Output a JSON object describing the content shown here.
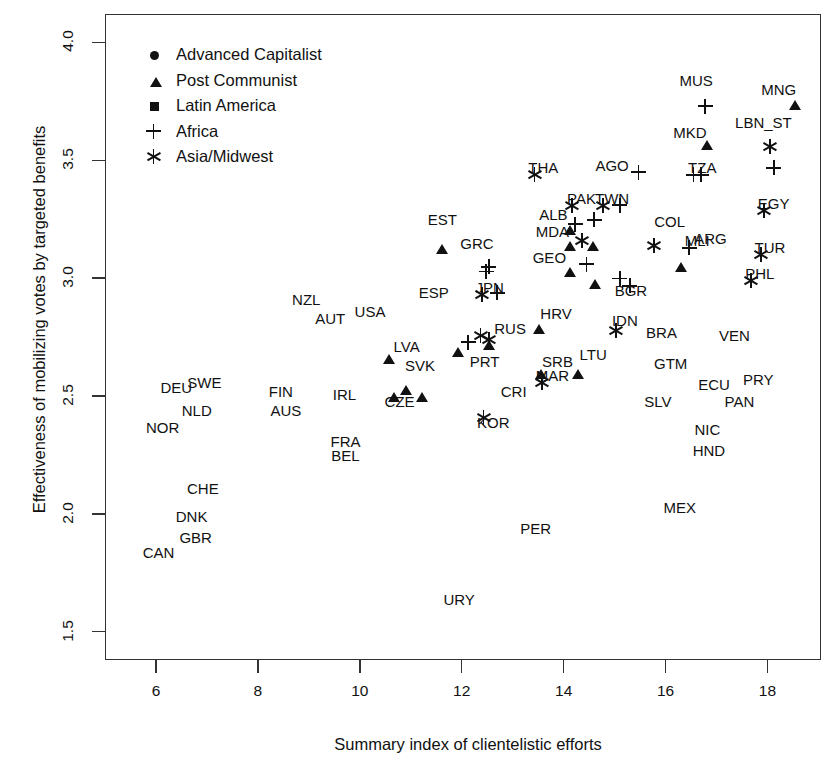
{
  "chart_data": {
    "type": "scatter",
    "title": "",
    "xlabel": "Summary index of clientelistic efforts",
    "ylabel": "Effectiveness of mobilizing votes by targeted benefits",
    "xlim": [
      5.0,
      19.05
    ],
    "ylim": [
      1.38,
      4.12
    ],
    "xticks": [
      6,
      8,
      10,
      12,
      14,
      16,
      18
    ],
    "xtick_labels": [
      "6",
      "8",
      "10",
      "12",
      "14",
      "16",
      "18"
    ],
    "yticks": [
      1.5,
      2.0,
      2.5,
      3.0,
      3.5,
      4.0
    ],
    "ytick_labels": [
      "1.5",
      "2.0",
      "2.5",
      "3.0",
      "3.5",
      "4.0"
    ],
    "grid": false,
    "legend_position": "top-left",
    "legend": [
      {
        "label": "Advanced Capitalist",
        "marker": "circle",
        "icon": "filled-circle-icon"
      },
      {
        "label": "Post Communist",
        "marker": "triangle",
        "icon": "filled-triangle-icon"
      },
      {
        "label": "Latin America",
        "marker": "square",
        "icon": "filled-square-icon"
      },
      {
        "label": "Africa",
        "marker": "plus",
        "icon": "plus-icon"
      },
      {
        "label": "Asia/Midwest",
        "marker": "star",
        "icon": "asterisk-icon"
      }
    ],
    "series": [
      {
        "name": "Advanced Capitalist",
        "marker": "circle",
        "points": [
          {
            "label": "CAN",
            "x": 5.8,
            "y": 1.89,
            "lx": 6.05,
            "ly": 1.84
          },
          {
            "label": "DNK",
            "x": 6.3,
            "y": 1.96,
            "lx": 6.7,
            "ly": 1.99
          },
          {
            "label": "GBR",
            "x": 6.36,
            "y": 1.94,
            "lx": 6.78,
            "ly": 1.9
          },
          {
            "label": "CHE",
            "x": 6.5,
            "y": 2.11,
            "lx": 6.92,
            "ly": 2.11
          },
          {
            "label": "NOR",
            "x": 6.02,
            "y": 2.42,
            "lx": 6.13,
            "ly": 2.37
          },
          {
            "label": "NLD",
            "x": 6.37,
            "y": 2.44,
            "lx": 6.8,
            "ly": 2.44
          },
          {
            "label": "DEU",
            "x": 6.6,
            "y": 2.47,
            "lx": 6.4,
            "ly": 2.54
          },
          {
            "label": "SWE",
            "x": 6.82,
            "y": 2.5,
            "lx": 6.95,
            "ly": 2.56
          },
          {
            "label": "FIN",
            "x": 8.1,
            "y": 2.52,
            "lx": 8.45,
            "ly": 2.52
          },
          {
            "label": "AUS",
            "x": 8.18,
            "y": 2.44,
            "lx": 8.55,
            "ly": 2.44
          },
          {
            "label": "IRL",
            "x": 9.32,
            "y": 2.51,
            "lx": 9.7,
            "ly": 2.51
          },
          {
            "label": "FRA",
            "x": 9.35,
            "y": 2.31,
            "lx": 9.72,
            "ly": 2.31
          },
          {
            "label": "BEL",
            "x": 9.35,
            "y": 2.25,
            "lx": 9.72,
            "ly": 2.25
          },
          {
            "label": "NZL",
            "x": 8.85,
            "y": 2.84,
            "lx": 8.95,
            "ly": 2.91
          },
          {
            "label": "AUT",
            "x": 9.33,
            "y": 2.76,
            "lx": 9.42,
            "ly": 2.83
          },
          {
            "label": "USA",
            "x": 10.15,
            "y": 2.79,
            "lx": 10.2,
            "ly": 2.86
          },
          {
            "label": "ESP",
            "x": 11.42,
            "y": 2.87,
            "lx": 11.45,
            "ly": 2.94
          },
          {
            "label": "PRT",
            "x": 12.13,
            "y": 2.67,
            "lx": 12.45,
            "ly": 2.65
          },
          {
            "label": "GRC",
            "x": 12.33,
            "y": 3.09,
            "lx": 12.3,
            "ly": 3.15
          },
          {
            "label": "RUS",
            "x": 12.65,
            "y": 2.79,
            "lx": 12.95,
            "ly": 2.79
          }
        ]
      },
      {
        "name": "Post Communist",
        "marker": "triangle",
        "points": [
          {
            "label": "LVA",
            "x": 10.58,
            "y": 2.71,
            "lx": 10.92,
            "ly": 2.71
          },
          {
            "label": "CZE",
            "x": 10.68,
            "y": 2.55,
            "lx": 10.78,
            "ly": 2.48
          },
          {
            "label": "SVK",
            "x": 10.9,
            "y": 2.58,
            "lx": 11.18,
            "ly": 2.63
          },
          {
            "label": "SVK2",
            "x": 11.22,
            "y": 2.55,
            "lx": null,
            "ly": null
          },
          {
            "label": "EST",
            "x": 11.62,
            "y": 3.18,
            "lx": 11.62,
            "ly": 3.25
          },
          {
            "label": "HRV",
            "x": 13.52,
            "y": 2.84,
            "lx": 13.85,
            "ly": 2.85
          },
          {
            "label": "SRB",
            "x": 13.55,
            "y": 2.65,
            "lx": 13.88,
            "ly": 2.65
          },
          {
            "label": "LTU",
            "x": 14.28,
            "y": 2.65,
            "lx": 14.58,
            "ly": 2.68
          },
          {
            "label": "ALB",
            "x": 14.12,
            "y": 3.26,
            "lx": 13.8,
            "ly": 3.27
          },
          {
            "label": "MDA",
            "x": 14.12,
            "y": 3.19,
            "lx": 13.78,
            "ly": 3.2
          },
          {
            "label": "GEO",
            "x": 14.12,
            "y": 3.08,
            "lx": 13.72,
            "ly": 3.09
          },
          {
            "label": "MKD",
            "x": 16.82,
            "y": 3.62,
            "lx": 16.48,
            "ly": 3.62
          },
          {
            "label": "MNG",
            "x": 18.53,
            "y": 3.79,
            "lx": 18.22,
            "ly": 3.8
          },
          {
            "label": "T1",
            "x": 14.58,
            "y": 3.19,
            "lx": null,
            "ly": null
          },
          {
            "label": "T2",
            "x": 14.62,
            "y": 3.03,
            "lx": null,
            "ly": null
          },
          {
            "label": "T3",
            "x": 12.53,
            "y": 2.77,
            "lx": null,
            "ly": null
          },
          {
            "label": "T4",
            "x": 11.93,
            "y": 2.74,
            "lx": null,
            "ly": null
          },
          {
            "label": "T5",
            "x": 16.3,
            "y": 3.1,
            "lx": null,
            "ly": null
          }
        ]
      },
      {
        "name": "Latin America",
        "marker": "square",
        "points": [
          {
            "label": "URY",
            "x": 11.6,
            "y": 1.64,
            "lx": 11.95,
            "ly": 1.64
          },
          {
            "label": "PER",
            "x": 13.1,
            "y": 1.94,
            "lx": 13.45,
            "ly": 1.94
          },
          {
            "label": "MEX",
            "x": 15.92,
            "y": 2.03,
            "lx": 16.28,
            "ly": 2.03
          },
          {
            "label": "CRI",
            "x": 12.7,
            "y": 2.51,
            "lx": 13.02,
            "ly": 2.52
          },
          {
            "label": "NIC",
            "x": 16.48,
            "y": 2.34,
            "lx": 16.82,
            "ly": 2.36
          },
          {
            "label": "HND",
            "x": 16.48,
            "y": 2.31,
            "lx": 16.85,
            "ly": 2.27
          },
          {
            "label": "SLV",
            "x": 15.88,
            "y": 2.55,
            "lx": 15.85,
            "ly": 2.48
          },
          {
            "label": "ECU",
            "x": 16.58,
            "y": 2.55,
            "lx": 16.95,
            "ly": 2.55
          },
          {
            "label": "PRY",
            "x": 17.45,
            "y": 2.57,
            "lx": 17.82,
            "ly": 2.57
          },
          {
            "label": "PAN",
            "x": 17.08,
            "y": 2.48,
            "lx": 17.45,
            "ly": 2.48
          },
          {
            "label": "GTM",
            "x": 15.75,
            "y": 2.64,
            "lx": 16.1,
            "ly": 2.64
          },
          {
            "label": "VEN",
            "x": 17.0,
            "y": 2.76,
            "lx": 17.35,
            "ly": 2.76
          },
          {
            "label": "BRA",
            "x": 15.55,
            "y": 2.77,
            "lx": 15.92,
            "ly": 2.77
          },
          {
            "label": "BGR",
            "x": 15.35,
            "y": 3.02,
            "lx": 15.32,
            "ly": 2.95
          },
          {
            "label": "COL",
            "x": 15.72,
            "y": 3.24,
            "lx": 16.08,
            "ly": 3.24
          },
          {
            "label": "ARG",
            "x": 16.85,
            "y": 3.24,
            "lx": 16.88,
            "ly": 3.17
          },
          {
            "label": "LBN_SQ",
            "x": 17.98,
            "y": 3.57,
            "lx": null,
            "ly": null
          },
          {
            "label": "S1",
            "x": 12.25,
            "y": 2.85,
            "lx": null,
            "ly": null
          }
        ]
      },
      {
        "name": "Africa",
        "marker": "plus",
        "points": [
          {
            "label": "MUS",
            "x": 16.63,
            "y": 3.76,
            "lx": 16.6,
            "ly": 3.84
          },
          {
            "label": "TZA",
            "x": 16.4,
            "y": 3.47,
            "lx": 16.72,
            "ly": 3.47
          },
          {
            "label": "TZA2",
            "x": 16.55,
            "y": 3.47,
            "lx": null,
            "ly": null
          },
          {
            "label": "AGO",
            "x": 15.32,
            "y": 3.48,
            "lx": 14.95,
            "ly": 3.48
          },
          {
            "label": "MLI",
            "x": 16.32,
            "y": 3.16,
            "lx": 16.62,
            "ly": 3.16
          },
          {
            "label": "LBN_PL",
            "x": 17.98,
            "y": 3.5,
            "lx": null,
            "ly": null
          },
          {
            "label": "P1",
            "x": 14.08,
            "y": 3.26,
            "lx": null,
            "ly": null
          },
          {
            "label": "P2",
            "x": 14.95,
            "y": 3.34,
            "lx": null,
            "ly": null
          },
          {
            "label": "P3",
            "x": 14.45,
            "y": 3.28,
            "lx": null,
            "ly": null
          },
          {
            "label": "P4",
            "x": 12.38,
            "y": 3.08,
            "lx": null,
            "ly": null
          },
          {
            "label": "P5",
            "x": 12.55,
            "y": 2.97,
            "lx": null,
            "ly": null
          },
          {
            "label": "P6",
            "x": 12.33,
            "y": 3.06,
            "lx": null,
            "ly": null
          },
          {
            "label": "P7",
            "x": 14.3,
            "y": 3.09,
            "lx": null,
            "ly": null
          },
          {
            "label": "P8",
            "x": 14.95,
            "y": 3.03,
            "lx": null,
            "ly": null
          },
          {
            "label": "P9",
            "x": 15.15,
            "y": 3.0,
            "lx": null,
            "ly": null
          },
          {
            "label": "P10",
            "x": 11.98,
            "y": 2.76,
            "lx": null,
            "ly": null
          }
        ]
      },
      {
        "name": "Asia/Midwest",
        "marker": "star",
        "points": [
          {
            "label": "KOR",
            "x": 12.28,
            "y": 2.44,
            "lx": 12.62,
            "ly": 2.39
          },
          {
            "label": "MAR",
            "x": 13.42,
            "y": 2.59,
            "lx": 13.78,
            "ly": 2.59
          },
          {
            "label": "JPN",
            "x": 12.25,
            "y": 2.96,
            "lx": 12.55,
            "ly": 2.96
          },
          {
            "label": "IDN",
            "x": 14.88,
            "y": 2.81,
            "lx": 15.2,
            "ly": 2.82
          },
          {
            "label": "THA",
            "x": 13.28,
            "y": 3.47,
            "lx": 13.6,
            "ly": 3.47
          },
          {
            "label": "PAK",
            "x": 14.02,
            "y": 3.34,
            "lx": 14.35,
            "ly": 3.34
          },
          {
            "label": "TWN",
            "x": 14.62,
            "y": 3.34,
            "lx": 14.95,
            "ly": 3.34
          },
          {
            "label": "EGY",
            "x": 17.78,
            "y": 3.32,
            "lx": 18.12,
            "ly": 3.32
          },
          {
            "label": "TUR",
            "x": 17.72,
            "y": 3.13,
            "lx": 18.05,
            "ly": 3.13
          },
          {
            "label": "PHL",
            "x": 17.52,
            "y": 3.02,
            "lx": 17.85,
            "ly": 3.02
          },
          {
            "label": "LBN_ST",
            "x": 17.9,
            "y": 3.59,
            "lx": 17.92,
            "ly": 3.66
          },
          {
            "label": "A1",
            "x": 12.22,
            "y": 2.79,
            "lx": null,
            "ly": null
          },
          {
            "label": "A2",
            "x": 12.38,
            "y": 2.77,
            "lx": null,
            "ly": null
          },
          {
            "label": "A3",
            "x": 14.22,
            "y": 3.19,
            "lx": null,
            "ly": null
          },
          {
            "label": "A4",
            "x": 15.62,
            "y": 3.17,
            "lx": null,
            "ly": null
          }
        ]
      }
    ]
  }
}
